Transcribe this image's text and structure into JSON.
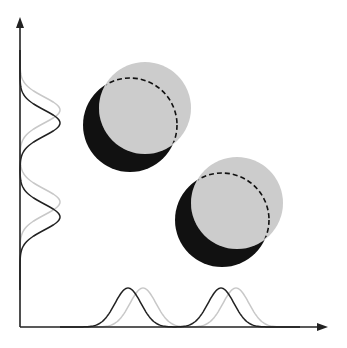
{
  "diagram": {
    "colors": {
      "black": "#111111",
      "gray": "#cccccc",
      "axis": "#222222",
      "curve_black": "#222222",
      "curve_gray": "#c8c8c8"
    },
    "pairs": [
      {
        "black": {
          "cx": 130,
          "cy": 125,
          "r": 47
        },
        "gray": {
          "cx": 145,
          "cy": 108,
          "r": 46
        }
      },
      {
        "black": {
          "cx": 222,
          "cy": 220,
          "r": 47
        },
        "gray": {
          "cx": 237,
          "cy": 203,
          "r": 46
        }
      }
    ],
    "x_axis": {
      "y": 327,
      "x_start": 20,
      "x_end": 328
    },
    "y_axis": {
      "x": 20,
      "y_start": 327,
      "y_end": 17
    },
    "x_marginal_peaks": {
      "black": [
        128,
        221
      ],
      "gray": [
        143,
        236
      ],
      "peak_y": 288
    },
    "y_marginal_peaks": {
      "black": [
        123,
        217
      ],
      "gray": [
        110,
        202
      ],
      "peak_x": 60
    }
  }
}
